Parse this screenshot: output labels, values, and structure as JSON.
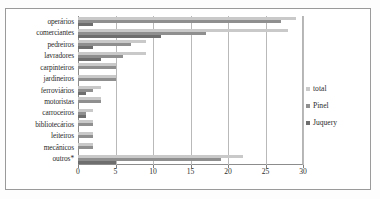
{
  "chart_data": {
    "type": "bar",
    "orientation": "horizontal",
    "title": "",
    "xlabel": "",
    "ylabel": "",
    "xlim": [
      0,
      30
    ],
    "xticks": [
      0,
      5,
      10,
      15,
      20,
      25,
      30
    ],
    "grid": true,
    "legend_position": "right",
    "categories": [
      "operários",
      "comerciantes",
      "pedreiros",
      "lavradores",
      "carpinteiros",
      "jardineiros",
      "ferroviários",
      "motoristas",
      "carroceiros",
      "bibliotecários",
      "leiteiros",
      "mecânicos",
      "outros*"
    ],
    "series": [
      {
        "name": "total",
        "color": "#c9c9c9",
        "values": [
          29,
          28,
          9,
          9,
          5,
          5,
          3,
          3,
          2,
          2,
          2,
          2,
          22
        ]
      },
      {
        "name": "Pinel",
        "color": "#8f8f8f",
        "values": [
          27,
          17,
          7,
          6,
          5,
          5,
          2,
          3,
          1,
          2,
          2,
          2,
          19
        ]
      },
      {
        "name": "Juquery",
        "color": "#6e6e6e",
        "values": [
          2,
          11,
          2,
          3,
          0,
          0,
          1,
          0,
          1,
          0,
          0,
          0,
          5
        ]
      }
    ]
  },
  "legend": {
    "items": [
      {
        "label": "total"
      },
      {
        "label": "Pinel"
      },
      {
        "label": "Juquery"
      }
    ]
  },
  "axis": {
    "x_tick_labels": [
      "0",
      "5",
      "10",
      "15",
      "20",
      "25",
      "30"
    ]
  }
}
